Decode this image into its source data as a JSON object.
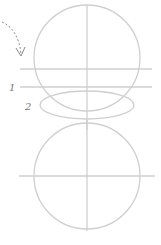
{
  "diagram": {
    "labels": {
      "one": "1",
      "two": "2"
    },
    "colors": {
      "guide": "#cfcfcf",
      "arrow": "#8a8a8a",
      "label": "#777777"
    }
  }
}
